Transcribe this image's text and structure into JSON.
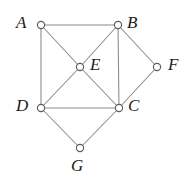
{
  "figure": {
    "width": 195,
    "height": 183,
    "background_color": "#ffffff",
    "edge_color": "#8a8a8a",
    "vertex_stroke_color": "#5a5a5a",
    "vertex_fill_color": "#ffffff",
    "label_color": "#1b1b1b"
  },
  "graph": {
    "vertices": [
      {
        "id": "A",
        "label": "A",
        "x": 41,
        "y": 25,
        "label_x": 16,
        "label_y": 14,
        "degree": 3
      },
      {
        "id": "B",
        "label": "B",
        "x": 118,
        "y": 25,
        "label_x": 127,
        "label_y": 14,
        "degree": 4
      },
      {
        "id": "C",
        "label": "C",
        "x": 119,
        "y": 108,
        "label_x": 128,
        "label_y": 97,
        "degree": 5
      },
      {
        "id": "D",
        "label": "D",
        "x": 41,
        "y": 108,
        "label_x": 16,
        "label_y": 97,
        "degree": 4
      },
      {
        "id": "E",
        "label": "E",
        "x": 80,
        "y": 67,
        "label_x": 90,
        "label_y": 56,
        "degree": 4
      },
      {
        "id": "F",
        "label": "F",
        "x": 157,
        "y": 67,
        "label_x": 168,
        "label_y": 56,
        "degree": 2
      },
      {
        "id": "G",
        "label": "G",
        "x": 80,
        "y": 148,
        "label_x": 71,
        "label_y": 157,
        "degree": 2
      }
    ],
    "edges": [
      {
        "id": "AB",
        "from": "A",
        "to": "B"
      },
      {
        "id": "AD",
        "from": "A",
        "to": "D"
      },
      {
        "id": "AE",
        "from": "A",
        "to": "E"
      },
      {
        "id": "EC",
        "from": "E",
        "to": "C"
      },
      {
        "id": "BE",
        "from": "B",
        "to": "E"
      },
      {
        "id": "ED",
        "from": "E",
        "to": "D"
      },
      {
        "id": "BC",
        "from": "B",
        "to": "C"
      },
      {
        "id": "BF",
        "from": "B",
        "to": "F"
      },
      {
        "id": "FC",
        "from": "F",
        "to": "C"
      },
      {
        "id": "DC",
        "from": "D",
        "to": "C"
      },
      {
        "id": "DG",
        "from": "D",
        "to": "G"
      },
      {
        "id": "GC",
        "from": "G",
        "to": "C"
      }
    ],
    "vertex_radius": 3.6
  }
}
